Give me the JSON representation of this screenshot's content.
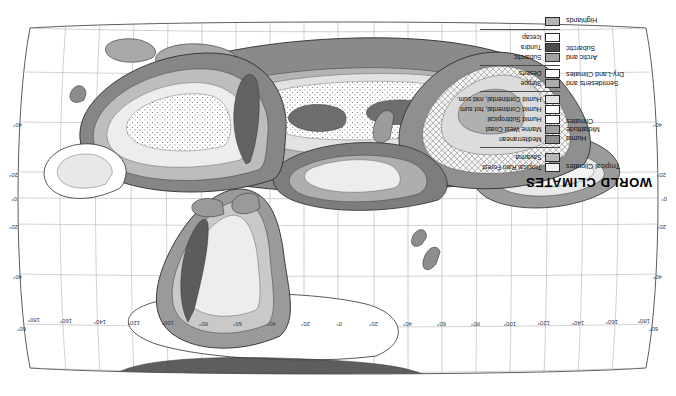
{
  "figure": {
    "title": "WORLD CLIMATES",
    "orientation": "rotated-180",
    "background": "#ffffff",
    "frame_color": "#4a4a4a"
  },
  "legend": {
    "title": "WORLD CLIMATES",
    "groups": [
      {
        "name": "tropical",
        "heading": "Tropical Climates",
        "items": [
          {
            "label": "Tropical Rain Forest",
            "color": "#f2f2f2"
          },
          {
            "label": "Savanna",
            "color": "#b9b9b9"
          }
        ]
      },
      {
        "name": "humid-midlatitude",
        "heading": "Humid\nMidlatitude\nClimates",
        "heading_lines": [
          "Humid",
          "Midlatitude",
          "Climates"
        ],
        "items": [
          {
            "label": "Mediterranean",
            "color": "#8d8d8d"
          },
          {
            "label": "Marine West Coast",
            "color": "#9f9f9f"
          },
          {
            "label": "Humid Subtropical",
            "color": "#ffffff"
          },
          {
            "label": "Humid Continental, hot sum.",
            "color": "#ffffff"
          },
          {
            "label": "Humid Continental, mid sum.",
            "color": "#e4e4e4"
          }
        ]
      },
      {
        "name": "dry-land",
        "heading": "Semideserts and\nDry-Land Climates",
        "heading_lines": [
          "Semideserts and",
          "Dry-Land Climates"
        ],
        "items": [
          {
            "label": "Steppe",
            "color": "#adadad"
          },
          {
            "label": "Deserts",
            "color": "#ffffff"
          }
        ]
      },
      {
        "name": "arctic-subarctic",
        "heading": "Arctic and\nSubarctic",
        "heading_lines": [
          "Arctic and",
          "Subarctic"
        ],
        "items": [
          {
            "label": "Subarctic",
            "color": "#a3a3a3"
          },
          {
            "label": "Tundra",
            "color": "#4d4d4d"
          },
          {
            "label": "Icecap",
            "color": "#ffffff"
          }
        ]
      },
      {
        "name": "highlands",
        "heading": "Highlands",
        "heading_lines": [
          "Highlands"
        ],
        "items": [
          {
            "label": "",
            "color": "#b4b4b4"
          }
        ]
      }
    ]
  },
  "graticule": {
    "longitude_labels": [
      "180°",
      "160°",
      "140°",
      "120°",
      "100°",
      "80°",
      "60°",
      "40°",
      "20°",
      "0°",
      "20°",
      "40°",
      "60°",
      "80°",
      "100°",
      "120°",
      "140°",
      "160°",
      "180°"
    ],
    "latitude_labels_right": [
      "60°",
      "40°",
      "20°",
      "0°",
      "20°",
      "40°"
    ],
    "latitude_labels_left": [
      "60°",
      "40°",
      "20°",
      "0°",
      "20°",
      "40°"
    ],
    "grid_spacing_degrees": 20
  },
  "map": {
    "projection": "robinson-like",
    "regions": [
      {
        "name": "north-america",
        "tone": "mixed"
      },
      {
        "name": "south-america",
        "tone": "mixed"
      },
      {
        "name": "africa",
        "tone": "mixed"
      },
      {
        "name": "eurasia",
        "tone": "mixed"
      },
      {
        "name": "australia",
        "tone": "mixed"
      },
      {
        "name": "antarctica",
        "tone": "icecap"
      },
      {
        "name": "greenland",
        "tone": "icecap"
      }
    ]
  }
}
